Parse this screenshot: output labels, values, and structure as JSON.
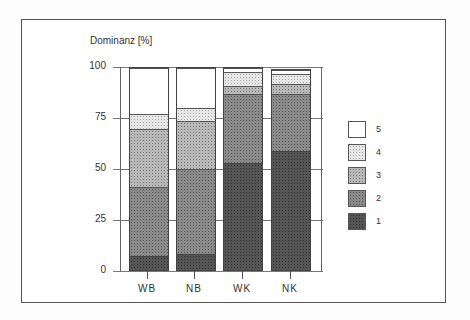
{
  "chart_data": {
    "type": "bar",
    "stacked": true,
    "title": "",
    "ylabel": "Dominanz [%]",
    "xlabel": "",
    "ylim": [
      0,
      100
    ],
    "yticks": [
      0,
      25,
      50,
      75,
      100
    ],
    "grid": true,
    "legend_position": "right",
    "categories": [
      "WB",
      "NB",
      "WK",
      "NK"
    ],
    "series": [
      {
        "name": "1",
        "values": [
          7,
          8,
          53,
          59
        ],
        "color": "#555555"
      },
      {
        "name": "2",
        "values": [
          34,
          42,
          34,
          28
        ],
        "color": "#8a8a8a"
      },
      {
        "name": "3",
        "values": [
          29,
          24,
          4,
          5
        ],
        "color": "#b8b8b8"
      },
      {
        "name": "4",
        "values": [
          7,
          6,
          7,
          5
        ],
        "color": "#e6e6e6"
      },
      {
        "name": "5",
        "values": [
          23,
          20,
          2,
          2
        ],
        "color": "#ffffff"
      }
    ]
  },
  "axis": {
    "ylabel": "Dominanz [%]",
    "yticks": [
      "0",
      "25",
      "50",
      "75",
      "100"
    ],
    "xlabels": [
      "WB",
      "NB",
      "WK",
      "NK"
    ]
  },
  "legend": {
    "items": [
      "5",
      "4",
      "3",
      "2",
      "1"
    ]
  }
}
